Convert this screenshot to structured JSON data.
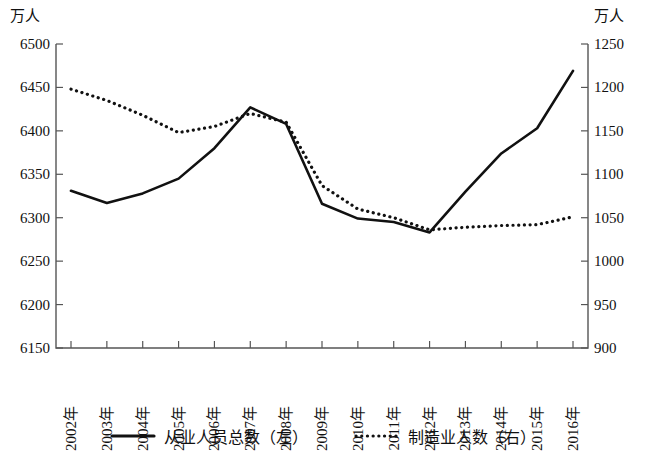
{
  "chart_data": {
    "type": "line",
    "title": "",
    "xlabel": "",
    "left_axis": {
      "unit": "万人",
      "min": 6150,
      "max": 6500,
      "step": 50,
      "ticks": [
        "6500",
        "6450",
        "6400",
        "6350",
        "6300",
        "6250",
        "6200",
        "6150"
      ],
      "tick_values": [
        6500,
        6450,
        6400,
        6350,
        6300,
        6250,
        6200,
        6150
      ]
    },
    "right_axis": {
      "unit": "万人",
      "min": 900,
      "max": 1250,
      "step": 50,
      "ticks": [
        "1250",
        "1200",
        "1150",
        "1100",
        "1050",
        "1000",
        "950",
        "900"
      ],
      "tick_values": [
        1250,
        1200,
        1150,
        1100,
        1050,
        1000,
        950,
        900
      ]
    },
    "categories": [
      "2002年",
      "2003年",
      "2004年",
      "2005年",
      "2006年",
      "2007年",
      "2008年",
      "2009年",
      "2010年",
      "2011年",
      "2012年",
      "2013年",
      "2014年",
      "2015年",
      "2016年"
    ],
    "grid": false,
    "legend_position": "bottom",
    "series": [
      {
        "name": "从业人员总数（左）",
        "axis": "left",
        "style": "solid",
        "color": "#111111",
        "values": [
          6331,
          6317,
          6328,
          6345,
          6380,
          6427,
          6408,
          6316,
          6299,
          6295,
          6283,
          6330,
          6374,
          6403,
          6469
        ]
      },
      {
        "name": "制造业人数（右）",
        "axis": "right",
        "style": "dotted",
        "color": "#111111",
        "values": [
          1198,
          1185,
          1168,
          1148,
          1155,
          1170,
          1160,
          1087,
          1060,
          1050,
          1036,
          1039,
          1041,
          1042,
          1051
        ]
      }
    ]
  },
  "legend": {
    "items": [
      {
        "label": "从业人员总数（左）",
        "style": "solid"
      },
      {
        "label": "制造业人数（右）",
        "style": "dotted"
      }
    ]
  }
}
